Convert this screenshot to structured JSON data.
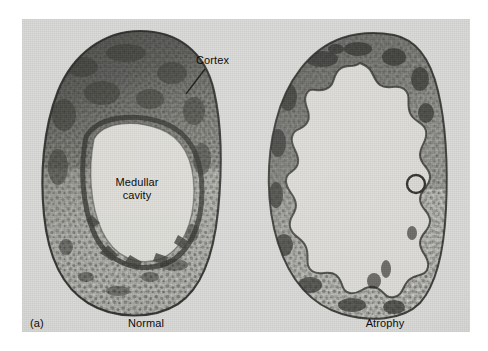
{
  "figure": {
    "panel_label": "(a)",
    "background_color": "#ffffff",
    "plate_color": "#d9d9d7",
    "ink_color": "#0d0d0d"
  },
  "annotations": {
    "cortex": "Cortex",
    "medullar_cavity_line1": "Medullar",
    "medullar_cavity_line2": "cavity"
  },
  "specimens": [
    {
      "name": "normal-bone-cross-section",
      "caption": "Normal",
      "description": "oval bone cross-section with thick dark cortex and small central medullary cavity"
    },
    {
      "name": "atrophy-bone-cross-section",
      "caption": "Atrophy",
      "description": "bone cross-section with thin ragged cortex and greatly enlarged medullary cavity"
    }
  ],
  "captions": {
    "left": "Normal",
    "right": "Atrophy"
  }
}
